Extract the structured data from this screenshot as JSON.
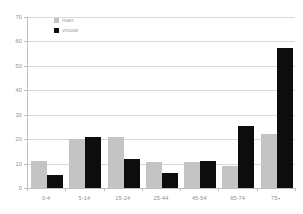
{
  "chart_data": {
    "type": "bar",
    "title": "",
    "xlabel": "",
    "ylabel": "",
    "categories": [
      "0-4",
      "5-14",
      "15-24",
      "25-44",
      "45-54",
      "65-74",
      "75+"
    ],
    "series": [
      {
        "name": "man",
        "color": "#c4c4c4",
        "values": [
          11,
          20,
          21,
          10.5,
          10.5,
          9,
          22
        ]
      },
      {
        "name": "vrouw",
        "color": "#0d0d0d",
        "values": [
          5.5,
          21,
          12,
          6,
          11,
          25.5,
          57.5
        ]
      }
    ],
    "ylim": [
      0,
      70
    ],
    "yticks": [
      0,
      10,
      20,
      30,
      40,
      50,
      60,
      70
    ],
    "ytick_labels": [
      "0",
      "10",
      "20",
      "30",
      "40",
      "50",
      "60",
      "70"
    ],
    "grid": true,
    "grid_axis": "y",
    "legend_position": "top-left-inside",
    "background": "#ffffff",
    "gridline_color": "#d9d9d9",
    "axis_color": "#bfbfbf",
    "tick_label_color": "#909090"
  },
  "legend": {
    "items": [
      {
        "label": "man",
        "swatch": "legend-swatch-man"
      },
      {
        "label": "vrouw",
        "swatch": "legend-swatch-vrouw"
      }
    ]
  }
}
